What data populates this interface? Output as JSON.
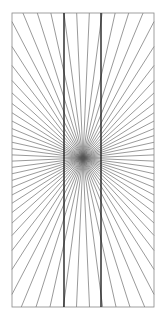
{
  "figure": {
    "title": "",
    "type": "hering-illusion",
    "frame": {
      "x1": 12,
      "y1": 13,
      "x2": 154,
      "y2": 307
    },
    "center": {
      "x": 83,
      "y": 158
    },
    "ray_count": 72,
    "vertical_lines": [
      64,
      101
    ],
    "colors": {
      "background": "#ffffff",
      "rays": "#555555",
      "frame": "#888888",
      "verticals": "#222222"
    }
  }
}
